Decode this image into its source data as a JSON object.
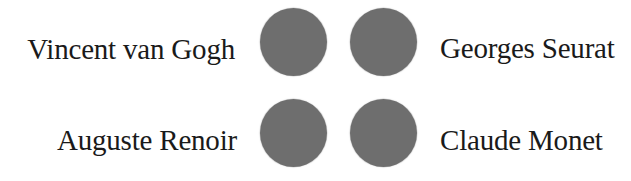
{
  "colors": {
    "dot": "#6e6e6e",
    "text": "#1a1a1a",
    "background": "#ffffff"
  },
  "rows": [
    {
      "left": {
        "label": "Vincent van Gogh",
        "icon": "filled-circle"
      },
      "right": {
        "label": "Georges Seurat",
        "icon": "filled-circle"
      }
    },
    {
      "left": {
        "label": "Auguste Renoir",
        "icon": "filled-circle"
      },
      "right": {
        "label": "Claude Monet",
        "icon": "filled-circle"
      }
    }
  ]
}
